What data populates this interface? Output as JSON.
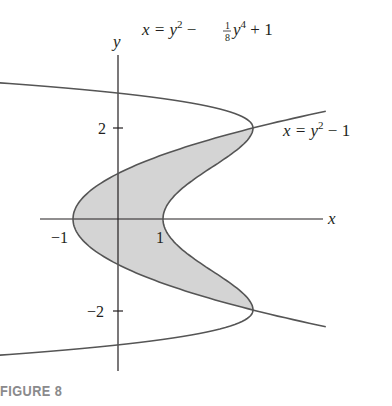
{
  "figure": {
    "caption": "FIGURE 8",
    "axes": {
      "x_label": "x",
      "y_label": "y"
    },
    "x_ticks": [
      {
        "value": -1,
        "label": "−1"
      },
      {
        "value": 1,
        "label": "1"
      }
    ],
    "y_ticks": [
      {
        "value": 2,
        "label": "2"
      },
      {
        "value": -2,
        "label": "−2"
      }
    ],
    "curve_labels": {
      "outer": {
        "lhs": "x = y",
        "exp1": "2",
        "minus": " − ",
        "frac_num": "1",
        "frac_den": "8",
        "y": "y",
        "exp2": "4",
        "tail": " + 1"
      },
      "inner": {
        "lhs": "x = y",
        "exp": "2",
        "tail": " − 1"
      }
    },
    "colors": {
      "curve": "#555555",
      "axis": "#231f20",
      "shade": "#d4d4d4",
      "caption": "#8a8a8c"
    }
  },
  "chart_data": {
    "type": "line",
    "title": "",
    "xlabel": "x",
    "ylabel": "y",
    "series": [
      {
        "name": "x = y^2 - (1/8)y^4 + 1",
        "equation": "x = y^2 - y^4/8 + 1",
        "points": [
          [
            -1.78,
            3.2
          ],
          [
            0,
            3.02
          ],
          [
            1,
            2.9
          ],
          [
            2,
            2.6
          ],
          [
            2.7,
            2.3
          ],
          [
            3,
            2
          ],
          [
            2.9,
            1.5
          ],
          [
            2.4,
            1
          ],
          [
            1.7,
            0.5
          ],
          [
            1,
            0
          ],
          [
            1.7,
            -0.5
          ],
          [
            2.4,
            -1
          ],
          [
            2.9,
            -1.5
          ],
          [
            3,
            -2
          ],
          [
            2.7,
            -2.3
          ],
          [
            2,
            -2.6
          ],
          [
            1,
            -2.9
          ],
          [
            0,
            -3.03
          ],
          [
            -1.78,
            -3.25
          ]
        ]
      },
      {
        "name": "x = y^2 - 1",
        "equation": "x = y^2 - 1",
        "points": [
          [
            4.5,
            2.35
          ],
          [
            3,
            2
          ],
          [
            1.25,
            1.5
          ],
          [
            0,
            1
          ],
          [
            -0.75,
            0.5
          ],
          [
            -1,
            0
          ],
          [
            -0.75,
            -0.5
          ],
          [
            0,
            -1
          ],
          [
            1.25,
            -1.5
          ],
          [
            3,
            -2
          ],
          [
            4.5,
            -2.35
          ]
        ]
      }
    ],
    "shaded_region": {
      "between": [
        "x = y^2 - 1",
        "x = y^2 - (1/8)y^4 + 1"
      ],
      "y_range": [
        -2,
        2
      ]
    },
    "intersections": [
      [
        3,
        2
      ],
      [
        3,
        -2
      ]
    ],
    "x_ticks": [
      -1,
      1
    ],
    "y_ticks": [
      -2,
      2
    ],
    "grid": false
  }
}
